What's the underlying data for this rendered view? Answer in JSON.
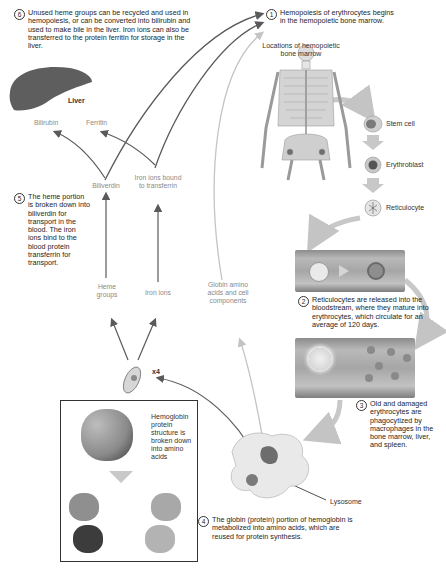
{
  "steps": [
    {
      "number": "1",
      "text": "Hemopoiesis of erythrocytes begins in the hemopoietic bone marrow."
    },
    {
      "number": "2",
      "text": "Reticulocytes are released into the bloodstream, where they mature into erythrocytes, which circulate for an average of 120 days."
    },
    {
      "number": "3",
      "text": "Old and damaged erythrocytes are phagocytized by macrophages in the bone marrow, liver, and spleen."
    },
    {
      "number": "4",
      "text": "The globin (protein) portion of hemoglobin is metabolized into amino acids, which are reused for protein synthesis."
    },
    {
      "number": "5",
      "text": "The heme portion is broken down into biliverdin for transport in the blood. The iron ions bind to the blood protein transferrin for transport."
    },
    {
      "number": "6",
      "text": "Unused heme groups can be recycled and used in hemopoiesis, or can be converted into bilirubin and used to make bile in the liver. Iron ions can also be transferred to the protein ferritin for storage in the liver."
    }
  ],
  "labels": {
    "bone_marrow_locations": "Locations of hemopoietic bone marrow",
    "stem_cell": "Stem cell",
    "erythroblast": "Erythroblast",
    "reticulocyte": "Reticulocyte",
    "liver": "Liver",
    "bilirubin": "Bilirubin",
    "ferritin": "Ferritin",
    "biliverdin": "Biliverdin",
    "iron_transferrin": "Iron ions bound to transferrin",
    "heme_groups": "Heme groups",
    "iron_ions": "Iron ions",
    "globin": "Globin amino acids and cell components",
    "x4": "x4",
    "hemoglobin_box": "Hemoglobin protein structure is broken down into amino acids",
    "lysosome": "Lysosome"
  },
  "colors": {
    "arrow_dark": "#5a5a5a",
    "arrow_light": "#c4c4c4",
    "block_arrow": "#c8c8c8",
    "vessel": "#a6a6a6"
  }
}
